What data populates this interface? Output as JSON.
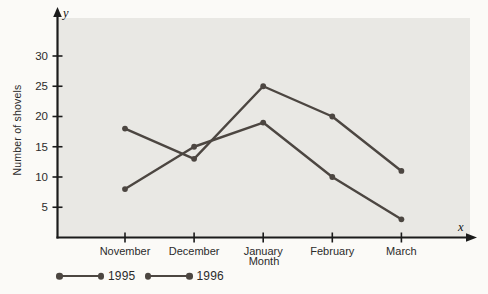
{
  "chart_data": {
    "type": "line",
    "categories": [
      "November",
      "December",
      "January",
      "February",
      "March"
    ],
    "series": [
      {
        "name": "1995",
        "values": [
          18,
          13,
          25,
          20,
          11
        ],
        "color": "#4c4641"
      },
      {
        "name": "1996",
        "values": [
          8,
          15,
          19,
          10,
          3
        ],
        "color": "#4c4641"
      }
    ],
    "xlabel": "Month",
    "ylabel": "Number of shovels",
    "x_axis_symbol": "x",
    "y_axis_symbol": "y",
    "y_ticks": [
      5,
      10,
      15,
      20,
      25,
      30
    ],
    "ylim": [
      0,
      34
    ],
    "grid": false,
    "legend_position": "bottom-left",
    "marker": "circle",
    "plot_bg_color": "#e9e8e4",
    "axis_color": "#1b1b1b",
    "text_color": "#2b2b2b"
  }
}
